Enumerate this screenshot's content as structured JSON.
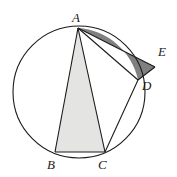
{
  "figure": {
    "background_color": "#ffffff",
    "stroke_color": "#1a1a1a",
    "light_shade_color": "#e4e4e2",
    "dark_shade_color": "#808080",
    "width": 177,
    "height": 177
  },
  "circle": {
    "name": "circumscribed-circle",
    "center_x": 79,
    "center_y": 92,
    "radius": 66,
    "stroke_width": 1.1
  },
  "points": {
    "A": {
      "label": "A",
      "x": 78,
      "y": 28,
      "label_x": 72,
      "label_y": 11
    },
    "B": {
      "label": "B",
      "x": 55,
      "y": 152,
      "label_x": 47,
      "label_y": 158
    },
    "C": {
      "label": "C",
      "x": 105,
      "y": 152,
      "label_x": 98,
      "label_y": 158
    },
    "D": {
      "label": "D",
      "x": 138,
      "y": 80,
      "label_x": 142,
      "label_y": 79
    },
    "E": {
      "label": "E",
      "x": 155,
      "y": 67,
      "label_x": 158,
      "label_y": 45
    }
  },
  "shapes": {
    "triangle_ABC": {
      "name": "triangle-abc",
      "vertices": "A,B,C",
      "fill": "#e4e4e2",
      "path": "M 78 28 L 55 152 L 105 152 Z"
    },
    "region_ADE": {
      "name": "region-ade",
      "vertices": "A,E,D",
      "fill": "#808080",
      "path": "M 78 28 L 155 67 L 138 80 A 66 66 0 0 0 78 28 Z"
    }
  },
  "segments": [
    {
      "name": "segment-ab",
      "from": "A",
      "to": "B",
      "x1": 78,
      "y1": 28,
      "x2": 55,
      "y2": 152
    },
    {
      "name": "segment-ac",
      "from": "A",
      "to": "C",
      "x1": 78,
      "y1": 28,
      "x2": 105,
      "y2": 152
    },
    {
      "name": "segment-bc",
      "from": "B",
      "to": "C",
      "x1": 55,
      "y1": 152,
      "x2": 105,
      "y2": 152
    },
    {
      "name": "segment-ad",
      "from": "A",
      "to": "D",
      "x1": 78,
      "y1": 28,
      "x2": 138,
      "y2": 80
    },
    {
      "name": "segment-ae",
      "from": "A",
      "to": "E",
      "x1": 78,
      "y1": 28,
      "x2": 155,
      "y2": 67
    },
    {
      "name": "segment-de",
      "from": "D",
      "to": "E",
      "x1": 138,
      "y1": 80,
      "x2": 155,
      "y2": 67
    },
    {
      "name": "segment-cd",
      "from": "C",
      "to": "D",
      "x1": 105,
      "y1": 152,
      "x2": 138,
      "y2": 80
    }
  ]
}
